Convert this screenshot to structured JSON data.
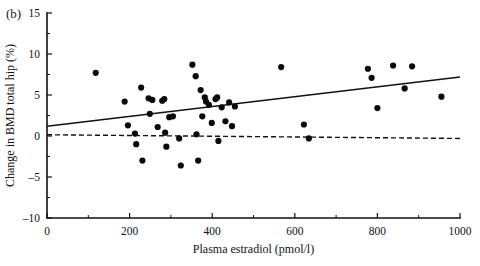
{
  "figure": {
    "panel_label": "(b)",
    "xlabel": "Plasma estradiol (pmol/l)",
    "ylabel": "Change in BMD total hip (%)"
  },
  "chart_data": {
    "type": "scatter",
    "title": "",
    "subtitle": "",
    "panel": "(b)",
    "xlabel": "Plasma estradiol (pmol/l)",
    "ylabel": "Change in BMD total hip (%)",
    "xlim": [
      0,
      1000
    ],
    "ylim": [
      -10,
      15
    ],
    "xticks": [
      0,
      200,
      400,
      600,
      800,
      1000
    ],
    "xtick_labels": [
      "0",
      "200",
      "400",
      "600",
      "800",
      "1000"
    ],
    "xticks_minor": [
      100,
      300,
      500,
      700,
      900
    ],
    "yticks": [
      -10,
      -5,
      0,
      5,
      10,
      15
    ],
    "ytick_labels": [
      "-10",
      "-5",
      "0",
      "5",
      "10",
      "15"
    ],
    "yticks_minor": [
      -7.5,
      -2.5,
      2.5,
      7.5,
      12.5
    ],
    "grid": false,
    "legend": null,
    "marker": "filled-circle",
    "marker_color": "#0a0a0a",
    "points": [
      {
        "x": 118,
        "y": 7.7
      },
      {
        "x": 188,
        "y": 4.2
      },
      {
        "x": 196,
        "y": 1.3
      },
      {
        "x": 213,
        "y": 0.3
      },
      {
        "x": 216,
        "y": -1.0
      },
      {
        "x": 228,
        "y": 5.9
      },
      {
        "x": 231,
        "y": -3.0
      },
      {
        "x": 246,
        "y": 4.6
      },
      {
        "x": 249,
        "y": 2.7
      },
      {
        "x": 255,
        "y": 4.4
      },
      {
        "x": 268,
        "y": 1.1
      },
      {
        "x": 279,
        "y": 4.3
      },
      {
        "x": 284,
        "y": 4.5
      },
      {
        "x": 286,
        "y": 0.4
      },
      {
        "x": 289,
        "y": -1.3
      },
      {
        "x": 296,
        "y": 2.3
      },
      {
        "x": 305,
        "y": 2.4
      },
      {
        "x": 320,
        "y": -0.3
      },
      {
        "x": 324,
        "y": -3.6
      },
      {
        "x": 352,
        "y": 8.7
      },
      {
        "x": 360,
        "y": 7.3
      },
      {
        "x": 362,
        "y": 0.2
      },
      {
        "x": 366,
        "y": -3.0
      },
      {
        "x": 372,
        "y": 5.6
      },
      {
        "x": 376,
        "y": 2.4
      },
      {
        "x": 382,
        "y": 4.7
      },
      {
        "x": 385,
        "y": 4.2
      },
      {
        "x": 392,
        "y": 3.8
      },
      {
        "x": 399,
        "y": 1.6
      },
      {
        "x": 408,
        "y": 4.5
      },
      {
        "x": 412,
        "y": 4.7
      },
      {
        "x": 415,
        "y": -0.6
      },
      {
        "x": 423,
        "y": 3.5
      },
      {
        "x": 432,
        "y": 1.8
      },
      {
        "x": 441,
        "y": 4.1
      },
      {
        "x": 448,
        "y": 1.2
      },
      {
        "x": 455,
        "y": 3.6
      },
      {
        "x": 567,
        "y": 8.4
      },
      {
        "x": 622,
        "y": 1.4
      },
      {
        "x": 634,
        "y": -0.3
      },
      {
        "x": 777,
        "y": 8.2
      },
      {
        "x": 786,
        "y": 7.1
      },
      {
        "x": 800,
        "y": 3.4
      },
      {
        "x": 838,
        "y": 8.6
      },
      {
        "x": 866,
        "y": 5.8
      },
      {
        "x": 884,
        "y": 8.5
      },
      {
        "x": 955,
        "y": 4.8
      }
    ],
    "fit_line": {
      "label": "regression line",
      "style": "solid",
      "x0": 0,
      "y0": 1.2,
      "x1": 1000,
      "y1": 7.2
    },
    "reference_line": {
      "label": "zero reference",
      "style": "dashed",
      "x0": 0,
      "y0": 0.15,
      "x1": 1000,
      "y1": -0.3
    }
  }
}
